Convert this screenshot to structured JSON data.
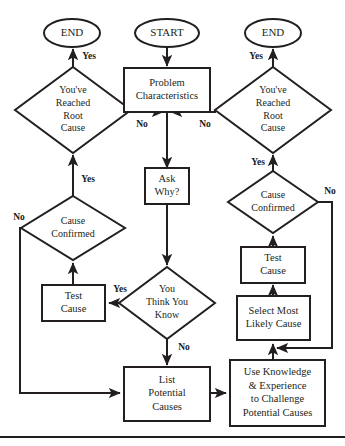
{
  "diagram": {
    "colors": {
      "stroke": "#231f20",
      "fill": "#ffffff",
      "label": "#1a1a1a"
    },
    "terminators": [
      {
        "id": "end-left",
        "label": "END",
        "cx": 72,
        "cy": 33,
        "rx": 28,
        "ry": 14
      },
      {
        "id": "start",
        "label": "START",
        "cx": 167,
        "cy": 33,
        "rx": 32,
        "ry": 14
      },
      {
        "id": "end-right",
        "label": "END",
        "cx": 273,
        "cy": 33,
        "rx": 28,
        "ry": 14
      }
    ],
    "processes": [
      {
        "id": "problem-characteristics",
        "lines": [
          "Problem",
          "Characteristics"
        ],
        "x": 124,
        "y": 68,
        "w": 86,
        "h": 44,
        "fs": 10.5
      },
      {
        "id": "ask-why",
        "lines": [
          "Ask",
          "Why?"
        ],
        "x": 145,
        "y": 168,
        "w": 44,
        "h": 36,
        "fs": 10.5
      },
      {
        "id": "test-cause-left",
        "lines": [
          "Test",
          "Cause"
        ],
        "x": 42,
        "y": 285,
        "w": 63,
        "h": 36,
        "fs": 10.5
      },
      {
        "id": "list-potential-causes",
        "lines": [
          "List",
          "Potential",
          "Causes"
        ],
        "x": 124,
        "y": 367,
        "w": 86,
        "h": 54,
        "fs": 10.5
      },
      {
        "id": "test-cause-right",
        "lines": [
          "Test",
          "Cause"
        ],
        "x": 241,
        "y": 247,
        "w": 64,
        "h": 36,
        "fs": 10.5
      },
      {
        "id": "select-most-likely",
        "lines": [
          "Select Most",
          "Likely Cause"
        ],
        "x": 237,
        "y": 296,
        "w": 73,
        "h": 44,
        "fs": 10.5
      },
      {
        "id": "use-knowledge",
        "lines": [
          "Use Knowledge",
          "& Experience",
          "to Challenge",
          "Potential Causes"
        ],
        "x": 230,
        "y": 360,
        "w": 95,
        "h": 66,
        "fs": 10.5
      }
    ],
    "decisions": [
      {
        "id": "root-cause-left",
        "lines": [
          "You've",
          "Reached",
          "Root",
          "Cause"
        ],
        "cx": 73,
        "cy": 110,
        "rx": 58,
        "ry": 43,
        "fs": 10
      },
      {
        "id": "root-cause-right",
        "lines": [
          "You've",
          "Reached",
          "Root",
          "Cause"
        ],
        "cx": 273,
        "cy": 110,
        "rx": 58,
        "ry": 43,
        "fs": 10
      },
      {
        "id": "cause-confirmed-left",
        "lines": [
          "Cause",
          "Confirmed"
        ],
        "cx": 73,
        "cy": 228,
        "rx": 52,
        "ry": 32,
        "fs": 10
      },
      {
        "id": "cause-confirmed-right",
        "lines": [
          "Cause",
          "Confirmed"
        ],
        "cx": 273,
        "cy": 202,
        "rx": 45,
        "ry": 31,
        "fs": 10
      },
      {
        "id": "you-think-you-know",
        "lines": [
          "You",
          "Think You",
          "Know"
        ],
        "cx": 167,
        "cy": 303,
        "rx": 48,
        "ry": 36,
        "fs": 10
      }
    ],
    "edge_labels": [
      {
        "id": "yes-left-root",
        "text": "Yes",
        "x": 89,
        "y": 57,
        "fs": 9.5
      },
      {
        "id": "yes-right-root",
        "text": "Yes",
        "x": 256,
        "y": 57,
        "fs": 9.5
      },
      {
        "id": "no-left-root",
        "text": "No",
        "x": 142,
        "y": 125,
        "fs": 9.5
      },
      {
        "id": "no-right-root",
        "text": "No",
        "x": 205,
        "y": 125,
        "fs": 9.5
      },
      {
        "id": "yes-left-confirmed",
        "text": "Yes",
        "x": 88,
        "y": 180,
        "fs": 9.5
      },
      {
        "id": "no-left-confirmed",
        "text": "No",
        "x": 19,
        "y": 218,
        "fs": 9.5
      },
      {
        "id": "yes-right-confirmed",
        "text": "Yes",
        "x": 258,
        "y": 163,
        "fs": 9.5
      },
      {
        "id": "no-right-confirmed",
        "text": "No",
        "x": 330,
        "y": 192,
        "fs": 9.5
      },
      {
        "id": "yes-think-you-know",
        "text": "Yes",
        "x": 120,
        "y": 290,
        "fs": 9.5
      },
      {
        "id": "no-think-you-know",
        "text": "No",
        "x": 184,
        "y": 348,
        "fs": 9.5
      }
    ],
    "connectors": [
      {
        "id": "start-to-problem",
        "d": "M167,47 L167,66",
        "arrow": true
      },
      {
        "id": "problem-to-junction",
        "d": "M167,112 L167,168",
        "arrow": true
      },
      {
        "id": "left-root-to-end",
        "d": "M73,67 L73,49",
        "arrow": true
      },
      {
        "id": "right-root-to-end",
        "d": "M273,67 L273,49",
        "arrow": true
      },
      {
        "id": "left-root-no-to-junction",
        "d": "M131,110 L131,112 L163,112",
        "arrow": true
      },
      {
        "id": "right-root-no-to-junction",
        "d": "M215,110 L215,112 L171,112",
        "arrow": true
      },
      {
        "id": "left-confirmed-yes-to-root",
        "d": "M73,196 L73,155",
        "arrow": true
      },
      {
        "id": "right-confirmed-yes-to-root",
        "d": "M273,171 L273,155",
        "arrow": true
      },
      {
        "id": "left-test-to-confirmed",
        "d": "M73,285 L73,263",
        "arrow": true
      },
      {
        "id": "right-test-to-confirmed",
        "d": "M273,247 L273,236",
        "arrow": true
      },
      {
        "id": "select-to-right-test",
        "d": "M273,296 L273,285",
        "arrow": true
      },
      {
        "id": "think-yes-to-left-test",
        "d": "M134,303 L109,303",
        "arrow": true
      },
      {
        "id": "think-no-to-list",
        "d": "M167,339 L167,365",
        "arrow": true
      },
      {
        "id": "list-to-use-knowledge",
        "d": "M210,393 L226,393",
        "arrow": true
      },
      {
        "id": "use-knowledge-to-select",
        "d": "M273,360 L273,344",
        "arrow": true
      },
      {
        "id": "left-confirmed-no-loop",
        "d": "M30,228 L20,228 L20,393 L120,393",
        "arrow": true
      },
      {
        "id": "right-confirmed-no-loop",
        "d": "M318,202 L332,202 L332,348 L277,348",
        "arrow": true
      },
      {
        "id": "ask-why-to-think",
        "d": "M167,204 L167,265",
        "arrow": true
      }
    ],
    "footer_rule": {
      "id": "footer-rule",
      "x1": 0,
      "y1": 437,
      "x2": 345,
      "y2": 437
    }
  }
}
